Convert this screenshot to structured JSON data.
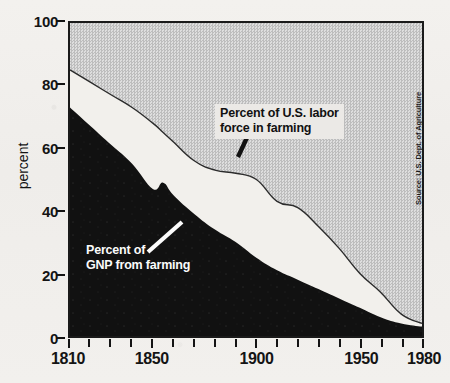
{
  "chart_data": {
    "type": "area",
    "title": "",
    "subtitle": "",
    "xlabel": "",
    "ylabel": "percent",
    "xlim": [
      1810,
      1980
    ],
    "ylim": [
      0,
      100
    ],
    "grid": false,
    "legend_position": "inline-annotations",
    "x_tick_labels": [
      "1810",
      "1850",
      "1900",
      "1950",
      "1980"
    ],
    "x_tick_values": [
      1810,
      1850,
      1900,
      1950,
      1980
    ],
    "x_minor_tick_values": [
      1820,
      1830,
      1840,
      1860,
      1870,
      1880,
      1890,
      1910,
      1920,
      1930,
      1940,
      1960,
      1970
    ],
    "y_tick_labels": [
      "100",
      "80",
      "60",
      "40",
      "20",
      "0"
    ],
    "y_tick_values": [
      100,
      80,
      60,
      40,
      20,
      0
    ],
    "x": [
      1810,
      1820,
      1830,
      1840,
      1850,
      1855,
      1860,
      1870,
      1880,
      1890,
      1900,
      1910,
      1920,
      1930,
      1940,
      1950,
      1960,
      1970,
      1980
    ],
    "series": [
      {
        "name": "Percent of U.S. labor force in farming",
        "color": "#f2f0ec",
        "fill": "light",
        "values": [
          85,
          81,
          77,
          73,
          68,
          65,
          62,
          56,
          53,
          52,
          50,
          43,
          41,
          35,
          28,
          20,
          14,
          7,
          4
        ]
      },
      {
        "name": "Percent of GNP from farming",
        "color": "#111111",
        "fill": "black",
        "values": [
          73,
          67,
          61,
          55,
          47,
          49,
          45,
          39,
          34,
          30,
          25,
          21,
          18,
          15,
          12,
          9,
          6,
          4,
          3
        ]
      }
    ],
    "annotations": [
      {
        "id": "labor-force",
        "text_lines": [
          "Percent of U.S. labor",
          "force in farming"
        ],
        "style": "black-on-light-box",
        "leader": "line-to-curve"
      },
      {
        "id": "gnp",
        "text_lines": [
          "Percent of",
          "GNP from farming"
        ],
        "style": "white-on-black",
        "leader": "line-to-curve"
      }
    ],
    "source": "Source: U.S. Dept. of Agriculture",
    "colors": {
      "remainder_band": "#d2d2d2",
      "labor_band": "#f2f0ec",
      "gnp_band": "#111111",
      "axis": "#141414",
      "page_background": "#f1efec"
    }
  }
}
